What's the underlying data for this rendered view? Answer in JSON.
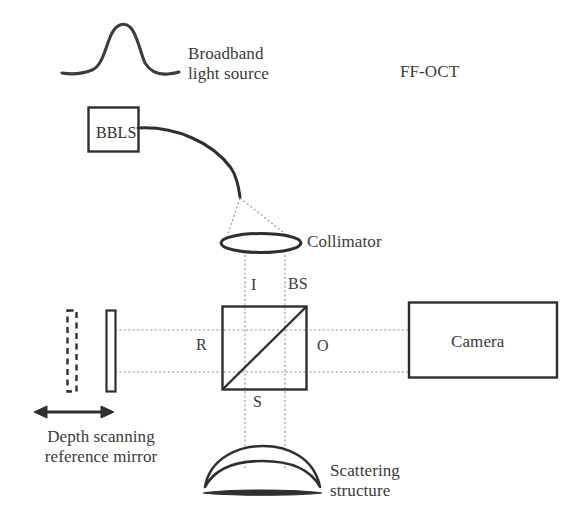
{
  "figure": {
    "title_label": "FF-OCT",
    "background_color": "#ffffff",
    "line_color": "#2f2f2f",
    "ray_color": "#8c8c8c",
    "text_color": "#3a3a3a"
  },
  "labels": {
    "broadband_source": "Broadband\nlight source",
    "bbls_box": "BBLS",
    "collimator": "Collimator",
    "beamsplitter": "BS",
    "input_port": "I",
    "reference_port": "R",
    "object_port": "O",
    "sample_port": "S",
    "camera": "Camera",
    "depth_scanning_mirror": "Depth scanning\nreference mirror",
    "scattering_structure": "Scattering\nstructure"
  },
  "components": {
    "spectrum_curve": {
      "name": "broadband-spectrum-gaussian",
      "x_range": [
        62,
        178
      ],
      "peak_y": 27,
      "baseline_y": 74
    },
    "bbls_box": {
      "x": 88,
      "y": 107,
      "width": 50,
      "height": 44
    },
    "fiber": {
      "start": [
        138,
        128
      ],
      "tip": [
        240,
        197
      ]
    },
    "collimator_lens": {
      "cx": 261,
      "cy": 243,
      "rx": 40,
      "ry": 9
    },
    "beamsplitter_cube": {
      "x": 222,
      "y": 306,
      "width": 85,
      "height": 84,
      "diagonal": "bottom-left-to-top-right"
    },
    "reference_mirror_solid": {
      "x": 106,
      "y": 310,
      "width": 10,
      "height": 82
    },
    "reference_mirror_dashed": {
      "x": 67,
      "y": 310,
      "width": 10,
      "height": 82
    },
    "scan_arrow": {
      "x1": 36,
      "x2": 112,
      "y": 412,
      "style": "double-headed"
    },
    "camera_box": {
      "x": 408,
      "y": 302,
      "width": 150,
      "height": 76
    },
    "scattering_structure": {
      "cx": 262,
      "cy": 470,
      "half_width": 58
    },
    "rays": {
      "vertical_ray_x": [
        245,
        285
      ],
      "horizontal_ray_y": [
        330,
        372
      ]
    }
  }
}
